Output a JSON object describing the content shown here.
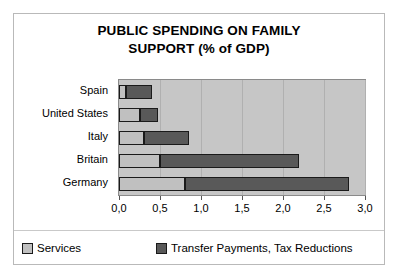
{
  "chart_data": {
    "type": "bar",
    "orientation": "horizontal",
    "stacked": true,
    "title": "PUBLIC SPENDING ON FAMILY SUPPORT (% of GDP)",
    "title_lines": [
      "PUBLIC SPENDING ON FAMILY",
      "SUPPORT (% of GDP)"
    ],
    "categories": [
      "Spain",
      "United States",
      "Italy",
      "Britain",
      "Germany"
    ],
    "series": [
      {
        "name": "Services",
        "color": "#c0c0c0",
        "values": [
          0.08,
          0.25,
          0.3,
          0.5,
          0.8
        ]
      },
      {
        "name": "Transfer Payments, Tax Reductions",
        "color": "#595959",
        "values": [
          0.32,
          0.23,
          0.55,
          1.7,
          2.0
        ]
      }
    ],
    "totals": [
      0.4,
      0.48,
      0.85,
      2.2,
      2.8
    ],
    "xlabel": "",
    "ylabel": "",
    "xlim": [
      0,
      3
    ],
    "xticks": [
      0,
      0.5,
      1,
      1.5,
      2,
      2.5,
      3
    ],
    "xtick_labels": [
      "0,0",
      "0,5",
      "1,0",
      "1,5",
      "2,0",
      "2,5",
      "3,0"
    ],
    "decimal_separator": ",",
    "grid": true,
    "grid_axis": "x",
    "legend_position": "bottom",
    "plot_background": "#c6c6c6"
  },
  "legend": {
    "entries": [
      {
        "label": "Services",
        "swatch": "services"
      },
      {
        "label": "Transfer Payments, Tax Reductions",
        "swatch": "transfers"
      }
    ]
  }
}
